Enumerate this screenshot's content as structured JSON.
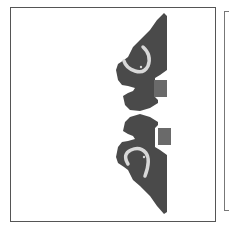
{
  "figure": {
    "type": "patent-drawing",
    "colors": {
      "body": "#4a4a4a",
      "heel_block": "#6a6a6a",
      "strap": "#d8d8d8",
      "frame": "#555555",
      "background": "#ffffff"
    },
    "panels": [
      {
        "name": "main-panel",
        "visible": "full"
      },
      {
        "name": "adjacent-panel",
        "visible": "partial, cropped at right edge"
      }
    ],
    "shoes": [
      {
        "name": "upper-shoe",
        "orientation": "toe up, sole on right"
      },
      {
        "name": "lower-shoe",
        "orientation": "toe down, sole on right"
      }
    ]
  }
}
